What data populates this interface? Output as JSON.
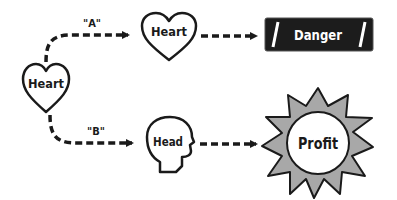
{
  "diagram": {
    "nodes": {
      "start": {
        "shape": "heart",
        "label": "Heart"
      },
      "top_mid": {
        "shape": "heart",
        "label": "Heart"
      },
      "danger": {
        "shape": "banner",
        "label": "Danger"
      },
      "bottom_mid": {
        "shape": "head",
        "label": "Head"
      },
      "profit": {
        "shape": "starburst",
        "label": "Profit"
      }
    },
    "edges": [
      {
        "from": "start",
        "to": "top_mid",
        "label": "\"A\"",
        "style": "dashed"
      },
      {
        "from": "top_mid",
        "to": "danger",
        "label": "",
        "style": "dashed"
      },
      {
        "from": "start",
        "to": "bottom_mid",
        "label": "\"B\"",
        "style": "dashed"
      },
      {
        "from": "bottom_mid",
        "to": "profit",
        "label": "",
        "style": "dashed"
      }
    ],
    "colors": {
      "stroke": "#1a1a1a",
      "banner_fill": "#1c1c1c",
      "banner_text": "#ffffff",
      "star_fill": "#a8a8a8"
    }
  }
}
